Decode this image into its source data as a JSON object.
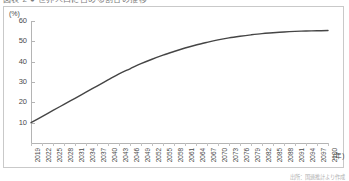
{
  "header": {
    "title_truncated": "図表 2 ● 世界人口に占める割合の推移"
  },
  "footer": {
    "source_note": "出所：国連推計より作成"
  },
  "chart_data": {
    "type": "line",
    "title": "",
    "xlabel": "(年)",
    "ylabel": "(%)",
    "ylim": [
      0,
      60
    ],
    "yticks": [
      10,
      20,
      30,
      40,
      50,
      60
    ],
    "grid": false,
    "legend": false,
    "line_color": "#454545",
    "axis_color": "#b4b4b4",
    "frame_color": "#c9c9c9",
    "categories": [
      "2019",
      "2022",
      "2025",
      "2028",
      "2031",
      "2034",
      "2037",
      "2040",
      "2043",
      "2046",
      "2049",
      "2052",
      "2055",
      "2058",
      "2061",
      "2064",
      "2067",
      "2070",
      "2073",
      "2076",
      "2079",
      "2082",
      "2085",
      "2088",
      "2091",
      "2094",
      "2097",
      "2100"
    ],
    "series": [
      {
        "name": "割合",
        "values": [
          10.0,
          13.0,
          16.0,
          19.0,
          22.0,
          25.0,
          28.0,
          31.0,
          34.0,
          36.5,
          39.0,
          41.2,
          43.2,
          45.0,
          46.7,
          48.2,
          49.5,
          50.7,
          51.7,
          52.5,
          53.2,
          53.8,
          54.2,
          54.6,
          54.9,
          55.1,
          55.2,
          55.3
        ]
      }
    ]
  }
}
